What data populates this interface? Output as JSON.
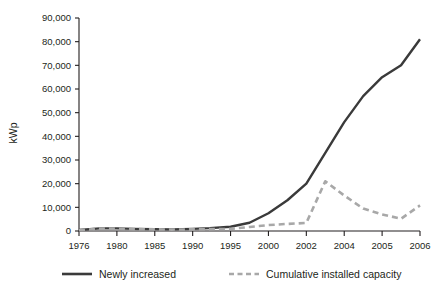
{
  "chart_data": {
    "type": "line",
    "title": "",
    "xlabel": "",
    "ylabel": "kWp",
    "categories": [
      "1976",
      "1980",
      "1985",
      "1990",
      "1995",
      "2000",
      "2002",
      "2004",
      "2005",
      "2006"
    ],
    "xtick_labels": [
      "1976",
      "1980",
      "1985",
      "1990",
      "1995",
      "2000",
      "2002",
      "2004",
      "2005",
      "2006"
    ],
    "ytick_labels": [
      "0",
      "10,000",
      "20,000",
      "30,000",
      "40,000",
      "50,000",
      "60,000",
      "70,000",
      "80,000",
      "90,000"
    ],
    "ytick_values": [
      0,
      10000,
      20000,
      30000,
      40000,
      50000,
      60000,
      70000,
      80000,
      90000
    ],
    "ylim": [
      0,
      90000
    ],
    "xlim": [
      0,
      9
    ],
    "grid": false,
    "legend_position": "bottom",
    "series": [
      {
        "name": "Newly increased",
        "style": "solid",
        "color": "#3a3a3a",
        "x": [
          0,
          0.55,
          1.0,
          1.45,
          2.0,
          2.45,
          3.0,
          3.45,
          4.0,
          4.5,
          5.0,
          5.5,
          6.0,
          6.5,
          7.0,
          7.5,
          8.0,
          8.5,
          9.0
        ],
        "values": [
          400,
          1100,
          1100,
          900,
          800,
          700,
          900,
          1200,
          1800,
          3500,
          7500,
          13000,
          20000,
          33000,
          46000,
          57000,
          65000,
          70000,
          81000
        ]
      },
      {
        "name": "Cumulative installed capacity",
        "style": "dashed",
        "color": "#a8a8a8",
        "x": [
          0,
          0.55,
          1.0,
          1.45,
          2.0,
          2.45,
          3.0,
          3.45,
          4.0,
          4.5,
          5.0,
          5.5,
          6.0,
          6.5,
          7.0,
          7.5,
          8.0,
          8.5,
          9.0
        ],
        "values": [
          300,
          1000,
          1000,
          800,
          700,
          600,
          700,
          800,
          900,
          1700,
          2500,
          3000,
          3400,
          21000,
          15000,
          9500,
          7000,
          5200,
          10800
        ]
      }
    ],
    "annotations": []
  },
  "legend": {
    "items": [
      {
        "label": "Newly increased",
        "style": "solid",
        "color": "#3a3a3a"
      },
      {
        "label": "Cumulative installed capacity",
        "style": "dashed",
        "color": "#a8a8a8"
      }
    ]
  }
}
